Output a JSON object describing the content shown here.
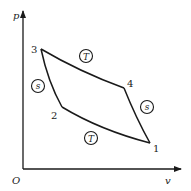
{
  "diagram": {
    "colors": {
      "stroke": "#1a1a1a",
      "background": "#ffffff"
    },
    "axes": {
      "y_label": "p",
      "x_label": "v",
      "origin_label": "O"
    },
    "points": [
      {
        "id": "1",
        "label": "1"
      },
      {
        "id": "2",
        "label": "2"
      },
      {
        "id": "3",
        "label": "3"
      },
      {
        "id": "4",
        "label": "4"
      }
    ],
    "process_markers": [
      {
        "id": "T_upper",
        "label": "T",
        "process": "3-4",
        "type": "isothermal"
      },
      {
        "id": "T_lower",
        "label": "T",
        "process": "1-2",
        "type": "isothermal"
      },
      {
        "id": "s_left",
        "label": "s",
        "process": "2-3",
        "type": "isentropic"
      },
      {
        "id": "s_right",
        "label": "s",
        "process": "4-1",
        "type": "isentropic"
      }
    ]
  }
}
